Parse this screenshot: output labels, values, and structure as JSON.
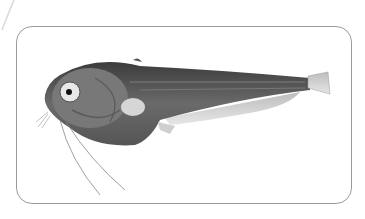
{
  "image": {
    "subject": "grayscale illustration of a fish with barbels",
    "colors": {
      "frame_border": "#9a9a9a",
      "body_dark": "#4a4a4a",
      "body_mid": "#7a7a7a",
      "fin_light": "#c8c8c8",
      "background": "#ffffff"
    }
  }
}
